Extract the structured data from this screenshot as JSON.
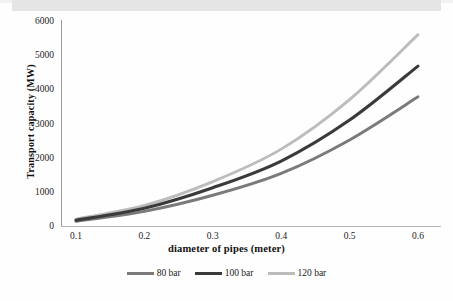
{
  "chart_data": {
    "type": "line",
    "title": "",
    "xlabel": "diameter of pipes (meter)",
    "ylabel": "Transport capacity (MW)",
    "x": [
      0.1,
      0.2,
      0.3,
      0.4,
      0.5,
      0.6
    ],
    "xtick_labels": [
      "0.1",
      "0.2",
      "0.3",
      "0.4",
      "0.5",
      "0.6"
    ],
    "ytick_labels": [
      "0",
      "1000",
      "2000",
      "3000",
      "4000",
      "5000",
      "6000"
    ],
    "yticks": [
      0,
      1000,
      2000,
      3000,
      4000,
      5000,
      6000
    ],
    "xlim": [
      0.1,
      0.6
    ],
    "ylim": [
      0,
      6000
    ],
    "grid": false,
    "legend_position": "bottom",
    "series": [
      {
        "name": "80 bar",
        "color": "#7a7a7a",
        "values": [
          140,
          430,
          900,
          1540,
          2520,
          3780
        ]
      },
      {
        "name": "100 bar",
        "color": "#3a3a3a",
        "values": [
          170,
          520,
          1120,
          1900,
          3100,
          4680
        ]
      },
      {
        "name": "120 bar",
        "color": "#bcbcbc",
        "values": [
          200,
          600,
          1300,
          2250,
          3700,
          5600
        ]
      }
    ]
  }
}
